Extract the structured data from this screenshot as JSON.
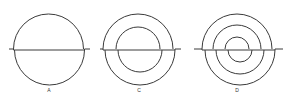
{
  "figures": [
    {
      "id": "A",
      "label": "A",
      "rings": 1
    },
    {
      "id": "C",
      "label": "C",
      "rings": 2
    },
    {
      "id": "D",
      "label": "D",
      "rings": 3
    }
  ],
  "colors": {
    "line": "#3a3a3a",
    "background": "#ffffff"
  }
}
